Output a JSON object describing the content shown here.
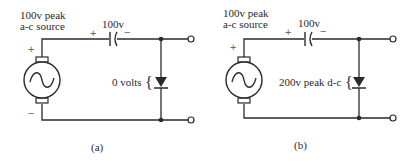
{
  "figure": {
    "panels": [
      {
        "id": "a",
        "caption": "(a)",
        "source_label_line1": "100v peak",
        "source_label_line2": "a-c source",
        "source_plus": "+",
        "source_minus": "−",
        "capacitor_label": "100v",
        "capacitor_plus": "+",
        "capacitor_minus": "−",
        "diode_label": "0 volts",
        "brace": "{"
      },
      {
        "id": "b",
        "caption": "(b)",
        "source_label_line1": "100v peak",
        "source_label_line2": "a-c source",
        "source_plus": "+",
        "source_minus": "−",
        "capacitor_label": "100v",
        "capacitor_plus": "+",
        "capacitor_minus": "−",
        "diode_label": "200v peak d-c",
        "brace": "{"
      }
    ],
    "icons": {
      "source": "ac-source-icon",
      "capacitor": "capacitor-icon",
      "diode": "diode-icon",
      "terminal": "terminal-icon",
      "junction": "junction-dot-icon"
    },
    "colors": {
      "ink": "#2a2a2a",
      "sign": "#6a6a6a",
      "background": "#ffffff"
    }
  }
}
